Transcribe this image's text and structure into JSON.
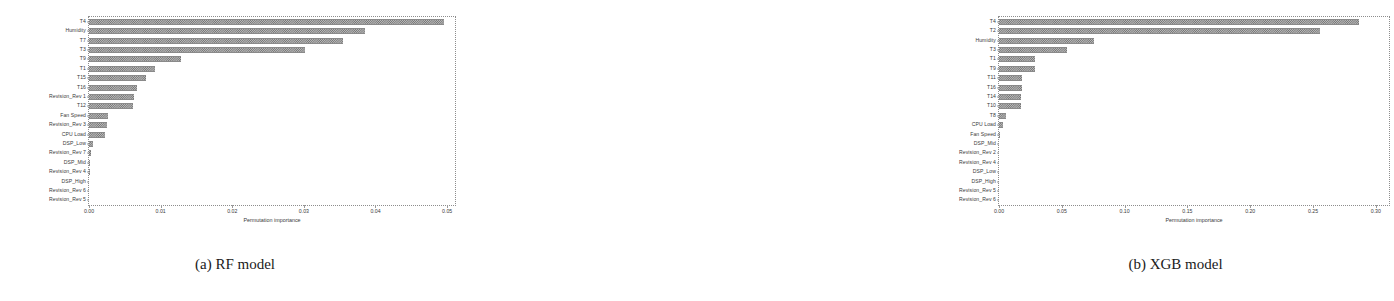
{
  "figure": {
    "panels": [
      {
        "id": "rf",
        "caption": "(a) RF model",
        "xlabel": "Permutation importance"
      },
      {
        "id": "xgb",
        "caption": "(b) XGB model",
        "xlabel": "Permutation importance"
      }
    ]
  },
  "chart_data": [
    {
      "type": "bar",
      "orientation": "horizontal",
      "panel": "(a) RF model",
      "title": "",
      "xlabel": "Permutation importance",
      "ylabel": "",
      "xlim": [
        0.0,
        0.0511
      ],
      "xticks": [
        0.0,
        0.01,
        0.02,
        0.03,
        0.04,
        0.05
      ],
      "xticklabels": [
        "0.00",
        "0.01",
        "0.02",
        "0.03",
        "0.04",
        "0.05"
      ],
      "grid": false,
      "legend": null,
      "categories": [
        "T4",
        "Humidity",
        "T7",
        "T3",
        "T9",
        "T1",
        "T15",
        "T16",
        "Revision_Rev 1",
        "T12",
        "Fan Speed",
        "Revision_Rev 3",
        "CPU Load",
        "DSP_Low",
        "Revision_Rev 7",
        "DSP_Mid",
        "Revision_Rev 4",
        "DSP_High",
        "Revision_Rev 6",
        "Revision_Rev 5"
      ],
      "values": [
        0.0496,
        0.0386,
        0.0355,
        0.0302,
        0.0128,
        0.0092,
        0.0079,
        0.0067,
        0.0063,
        0.0061,
        0.0026,
        0.0025,
        0.0022,
        0.0006,
        0.0003,
        0.0002,
        0.0001,
        0.0,
        0.0,
        0.0
      ]
    },
    {
      "type": "bar",
      "orientation": "horizontal",
      "panel": "(b) XGB model",
      "title": "",
      "xlabel": "Permutation importance",
      "ylabel": "",
      "xlim": [
        0.0,
        0.3105
      ],
      "xticks": [
        0.0,
        0.05,
        0.1,
        0.15,
        0.2,
        0.25,
        0.3
      ],
      "xticklabels": [
        "0.00",
        "0.05",
        "0.10",
        "0.15",
        "0.20",
        "0.25",
        "0.30"
      ],
      "grid": false,
      "legend": null,
      "categories": [
        "T4",
        "T2",
        "Humidity",
        "T3",
        "T1",
        "T9",
        "T11",
        "T16",
        "T14",
        "T10",
        "T8",
        "CPU Load",
        "Fan Speed",
        "DSP_Mid",
        "Revision_Rev 2",
        "Revision_Rev 4",
        "DSP_Low",
        "DSP_High",
        "Revision_Rev 5",
        "Revision_Rev 6"
      ],
      "values": [
        0.287,
        0.2555,
        0.0755,
        0.054,
        0.029,
        0.029,
        0.0185,
        0.018,
        0.0175,
        0.0175,
        0.0055,
        0.0035,
        0.001,
        0.0,
        0.0,
        0.0,
        0.0,
        0.0,
        0.0,
        0.0
      ]
    }
  ]
}
